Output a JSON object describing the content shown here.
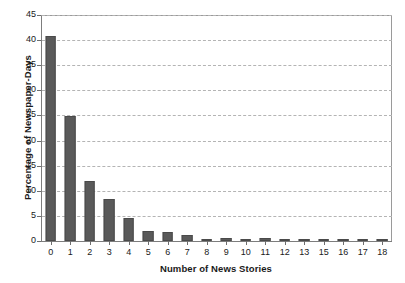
{
  "chart_data": {
    "type": "bar",
    "title": "",
    "xlabel": "Number of News Stories",
    "ylabel": "Percentage of Newspaper-Days",
    "categories": [
      "0",
      "1",
      "2",
      "3",
      "4",
      "5",
      "6",
      "7",
      "8",
      "9",
      "10",
      "11",
      "12",
      "13",
      "15",
      "16",
      "17",
      "18"
    ],
    "values": [
      40.8,
      24.8,
      12.0,
      8.3,
      4.5,
      2.0,
      1.8,
      1.1,
      0.25,
      0.6,
      0.2,
      0.55,
      0.2,
      0.1,
      0.1,
      0.1,
      0.2,
      0.1
    ],
    "ylim": [
      0,
      45
    ],
    "ytick_step": 5,
    "yticks": [
      "0",
      "5",
      "10",
      "15",
      "20",
      "25",
      "30",
      "35",
      "40",
      "45"
    ],
    "grid": true,
    "grid_style": "dashed-horizontal",
    "legend": null,
    "legend_position": "none",
    "bar_color": "#5a5a5a",
    "bar_edge_color": "#4a4a4a",
    "grid_color": "#b4b4b4",
    "axis_color": "#7d7d7d",
    "background_color": "#ffffff",
    "text_color": "#1a1a1a"
  }
}
